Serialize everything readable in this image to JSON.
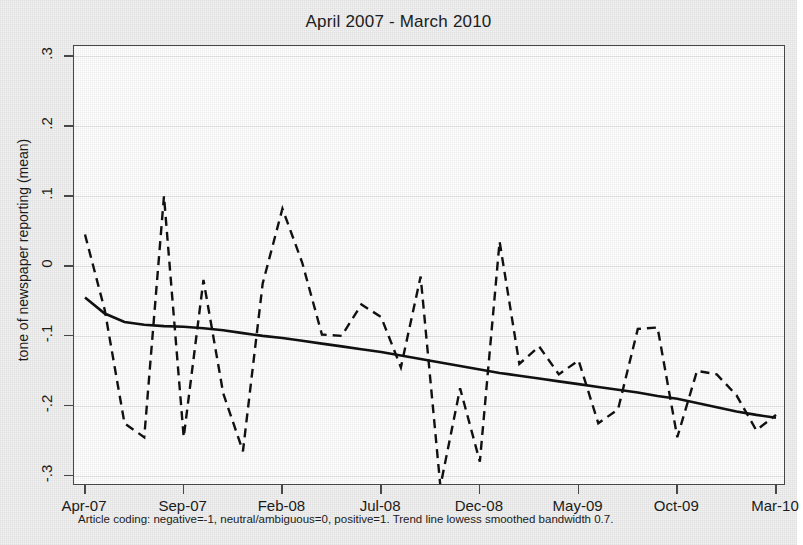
{
  "title": "April 2007 - March 2010",
  "footnote": "Article coding: negative=-1, neutral/ambiguous=0, positive=1. Trend line lowess smoothed bandwidth 0.7.",
  "axes": {
    "ylabel": "tone of newspaper reporting (mean)",
    "yticks": [
      ".3",
      ".2",
      ".1",
      "0",
      "-.1",
      "-.2",
      "-.3"
    ],
    "xticks": [
      "Apr-07",
      "Sep-07",
      "Feb-08",
      "Jul-08",
      "Dec-08",
      "May-09",
      "Oct-09",
      "Mar-10"
    ]
  },
  "colors": {
    "series_line": "#111111",
    "trend_line": "#111111",
    "axis": "#4a4a4a",
    "grid": "#e8e8e8",
    "plot_background": "#ffffff",
    "page_background": "#f1f1f1"
  },
  "chart_data": {
    "type": "line",
    "title": "April 2007 - March 2010",
    "xlabel": "",
    "ylabel": "tone of newspaper reporting (mean)",
    "ylim": [
      -0.3,
      0.3
    ],
    "yticks": [
      -0.3,
      -0.2,
      -0.1,
      0,
      0.1,
      0.2,
      0.3
    ],
    "grid": true,
    "legend": "none",
    "xtick_labels": [
      "Apr-07",
      "Sep-07",
      "Feb-08",
      "Jul-08",
      "Dec-08",
      "May-09",
      "Oct-09",
      "Mar-10"
    ],
    "xtick_indices": [
      0,
      5,
      10,
      15,
      20,
      25,
      30,
      35
    ],
    "x": [
      "Apr-07",
      "May-07",
      "Jun-07",
      "Jul-07",
      "Aug-07",
      "Sep-07",
      "Oct-07",
      "Nov-07",
      "Dec-07",
      "Jan-08",
      "Feb-08",
      "Mar-08",
      "Apr-08",
      "May-08",
      "Jun-08",
      "Jul-08",
      "Aug-08",
      "Sep-08",
      "Oct-08",
      "Nov-08",
      "Dec-08",
      "Jan-09",
      "Feb-09",
      "Mar-09",
      "Apr-09",
      "May-09",
      "Jun-09",
      "Jul-09",
      "Aug-09",
      "Sep-09",
      "Oct-09",
      "Nov-09",
      "Dec-09",
      "Jan-10",
      "Feb-10",
      "Mar-10"
    ],
    "series": [
      {
        "name": "monthly mean tone",
        "style": "dashed",
        "values": [
          0.045,
          -0.063,
          -0.225,
          -0.245,
          0.1,
          -0.245,
          -0.02,
          -0.182,
          -0.265,
          -0.025,
          0.082,
          0.005,
          -0.098,
          -0.1,
          -0.055,
          -0.073,
          -0.145,
          -0.015,
          -0.315,
          -0.175,
          -0.28,
          0.035,
          -0.14,
          -0.115,
          -0.155,
          -0.135,
          -0.225,
          -0.205,
          -0.09,
          -0.088,
          -0.245,
          -0.15,
          -0.155,
          -0.185,
          -0.235,
          -0.213
        ]
      },
      {
        "name": "lowess trend (bandwidth 0.7)",
        "style": "solid",
        "values": [
          -0.045,
          -0.068,
          -0.08,
          -0.084,
          -0.086,
          -0.087,
          -0.089,
          -0.092,
          -0.096,
          -0.1,
          -0.103,
          -0.107,
          -0.111,
          -0.115,
          -0.119,
          -0.123,
          -0.128,
          -0.133,
          -0.138,
          -0.143,
          -0.148,
          -0.153,
          -0.157,
          -0.161,
          -0.165,
          -0.169,
          -0.173,
          -0.177,
          -0.181,
          -0.186,
          -0.19,
          -0.196,
          -0.202,
          -0.208,
          -0.213,
          -0.217
        ]
      }
    ]
  }
}
